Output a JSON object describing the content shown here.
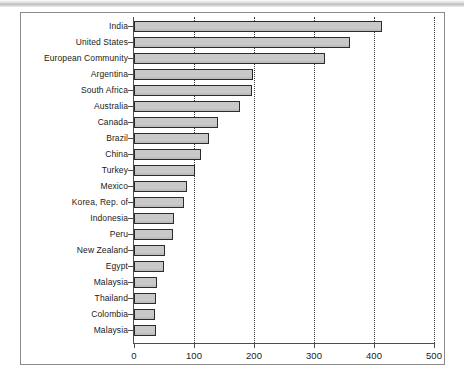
{
  "chart_data": {
    "type": "bar",
    "orientation": "horizontal",
    "title": "",
    "subtitle": "",
    "xlabel": "",
    "ylabel": "",
    "xlim": [
      0,
      500
    ],
    "xticks": [
      0,
      100,
      200,
      300,
      400,
      500
    ],
    "xtick_labels": [
      "0",
      "100",
      "200",
      "300",
      "400",
      "500"
    ],
    "grid": "vertical-dotted",
    "legend": null,
    "bar_fill_color": "#c9c9c9",
    "bar_edge_color": "#2b2b2b",
    "categories": [
      "India",
      "United States",
      "European Community",
      "Argentina",
      "South Africa",
      "Australia",
      "Canada",
      "Brazil",
      "China",
      "Turkey",
      "Mexico",
      "Korea, Rep. of",
      "Indonesia",
      "Peru",
      "New Zealand",
      "Egypt",
      "Malaysia",
      "Thailand",
      "Colombia",
      "Malaysia"
    ],
    "values": [
      413,
      360,
      318,
      198,
      196,
      177,
      140,
      125,
      112,
      102,
      88,
      83,
      66,
      65,
      51,
      50,
      38,
      37,
      35,
      37
    ]
  }
}
